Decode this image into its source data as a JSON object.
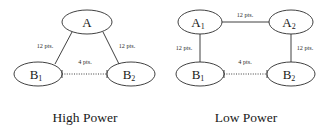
{
  "figure": {
    "background_color": "#ffffff",
    "stroke_color": "#2b2b2b",
    "text_color": "#1a1a1a",
    "panels": [
      {
        "id": "high-power",
        "caption": "High Power",
        "shape": "triangle",
        "nodes": [
          {
            "id": "A",
            "label": "A",
            "sub": "",
            "cx": 87,
            "cy": 22,
            "rx": 25,
            "ry": 12
          },
          {
            "id": "B1",
            "label": "B",
            "sub": "1",
            "cx": 38,
            "cy": 74,
            "rx": 24,
            "ry": 12
          },
          {
            "id": "B2",
            "label": "B",
            "sub": "2",
            "cx": 131,
            "cy": 74,
            "rx": 24,
            "ry": 12
          }
        ],
        "edges": [
          {
            "from": "B1",
            "to": "A",
            "style": "solid",
            "label": "12 pts.",
            "lx": 45,
            "ly": 48
          },
          {
            "from": "A",
            "to": "B2",
            "style": "solid",
            "label": "12 pts.",
            "lx": 127,
            "ly": 48
          },
          {
            "from": "B1",
            "to": "B2",
            "style": "dotted",
            "label": "4 pts.",
            "lx": 85,
            "ly": 64
          }
        ]
      },
      {
        "id": "low-power",
        "caption": "Low Power",
        "shape": "rectangle",
        "nodes": [
          {
            "id": "A1",
            "label": "A",
            "sub": "1",
            "cx": 200,
            "cy": 22,
            "rx": 22,
            "ry": 12
          },
          {
            "id": "A2",
            "label": "A",
            "sub": "2",
            "cx": 291,
            "cy": 22,
            "rx": 22,
            "ry": 12
          },
          {
            "id": "B1",
            "label": "B",
            "sub": "1",
            "cx": 200,
            "cy": 74,
            "rx": 24,
            "ry": 12
          },
          {
            "id": "B2",
            "label": "B",
            "sub": "2",
            "cx": 291,
            "cy": 74,
            "rx": 24,
            "ry": 12
          }
        ],
        "edges": [
          {
            "from": "A1",
            "to": "A2",
            "style": "solid",
            "label": "12 pts.",
            "lx": 245,
            "ly": 17
          },
          {
            "from": "A1",
            "to": "B1",
            "style": "solid",
            "label": "12 pts.",
            "lx": 184,
            "ly": 50
          },
          {
            "from": "A2",
            "to": "B2",
            "style": "solid",
            "label": "12 pts.",
            "lx": 305,
            "ly": 50
          },
          {
            "from": "B1",
            "to": "B2",
            "style": "dotted",
            "label": "4 pts.",
            "lx": 245,
            "ly": 64
          }
        ]
      }
    ],
    "captions": [
      {
        "text": "High Power",
        "x": 85,
        "y": 122
      },
      {
        "text": "Low Power",
        "x": 246,
        "y": 122
      }
    ]
  }
}
